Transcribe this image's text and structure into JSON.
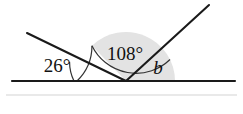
{
  "figure": {
    "type": "geometry-angle-diagram",
    "width": 243,
    "height": 114,
    "background_color": "#ffffff",
    "stroke_color": "#1a1a1a",
    "arc_color": "#333333",
    "shade_color": "#e3e3e3",
    "faint_rule_color": "#cfcfcf"
  },
  "labels": {
    "angle_left": "26°",
    "angle_middle": "108°",
    "angle_right": "b"
  },
  "values": {
    "angle_left_degrees": 26,
    "angle_middle_degrees": 108,
    "angle_right_degrees": 46
  },
  "points": {
    "baseline_left": {
      "x": 12,
      "y": 81
    },
    "baseline_right": {
      "x": 235,
      "y": 81
    },
    "vertex_left": {
      "x": 30,
      "y": 81
    },
    "vertex_main": {
      "x": 126,
      "y": 81
    },
    "transversal_top": {
      "x": 27,
      "y": 33
    },
    "ray_top_right": {
      "x": 209,
      "y": 5
    }
  },
  "arcs": {
    "arc_left": {
      "radius": 44,
      "start_degrees": 0,
      "end_degrees": 26
    },
    "arc_middle": {
      "radius": 49,
      "start_degrees": 26,
      "end_degrees": 134
    },
    "arc_right": {
      "radius": 49,
      "start_degrees": 134,
      "end_degrees": 180
    }
  },
  "label_positions": {
    "angle_left": {
      "x": 57,
      "y": 72
    },
    "angle_middle": {
      "x": 125,
      "y": 60
    },
    "angle_right": {
      "x": 158,
      "y": 74
    }
  }
}
